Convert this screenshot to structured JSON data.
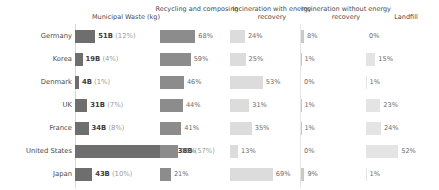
{
  "chart_data": {
    "type": "bar",
    "title": "",
    "subtitle": "",
    "xlabel": "",
    "ylabel": "",
    "grid": false,
    "legend": "none",
    "orientation": "horizontal",
    "layout": "small-multiples-row-per-country",
    "categories": [
      "Germany",
      "Korea",
      "Denmark",
      "UK",
      "France",
      "United States",
      "Japan"
    ],
    "columns": [
      {
        "key": "municipal_waste",
        "header": "Municipal Waste (kg)",
        "unit": "B",
        "value_suffix": "B",
        "max": 238,
        "color": "#6e6e6e"
      },
      {
        "key": "recycling_composting",
        "header": "Recycling and composing",
        "unit": "%",
        "max": 100,
        "color": "#8c8c8c"
      },
      {
        "key": "incineration_with_energy_recovery",
        "header": "Incineration with energy recovery",
        "unit": "%",
        "max": 100,
        "color": "#dcdcdc"
      },
      {
        "key": "incineration_without_energy_recovery",
        "header": "Incineration without energy recovery",
        "unit": "%",
        "max": 100,
        "color": "#c9c9c9"
      },
      {
        "key": "landfill",
        "header": "Landfill",
        "unit": "%",
        "max": 100,
        "color": "#e4e4e4"
      }
    ],
    "series": [
      {
        "name": "Municipal Waste (kg)",
        "values": [
          51,
          19,
          4,
          31,
          34,
          238,
          43
        ]
      },
      {
        "name": "Municipal Waste share",
        "values": [
          12,
          4,
          1,
          7,
          8,
          57,
          10
        ]
      },
      {
        "name": "Recycling and composing",
        "values": [
          68,
          59,
          46,
          44,
          41,
          35,
          21
        ]
      },
      {
        "name": "Incineration with energy recovery",
        "values": [
          24,
          25,
          53,
          31,
          35,
          13,
          69
        ]
      },
      {
        "name": "Incineration without energy recovery",
        "values": [
          8,
          1,
          0,
          1,
          1,
          0,
          9
        ]
      },
      {
        "name": "Landfill",
        "values": [
          0,
          15,
          1,
          23,
          24,
          52,
          1
        ]
      }
    ],
    "rows": [
      {
        "country": "Germany",
        "waste_value": "51B",
        "waste_pct": "(12%)",
        "waste_num": 51,
        "recycling": "68%",
        "recycling_num": 68,
        "incin_with": "24%",
        "incin_with_num": 24,
        "incin_without": "8%",
        "incin_without_num": 8,
        "landfill": "0%",
        "landfill_num": 0
      },
      {
        "country": "Korea",
        "waste_value": "19B",
        "waste_pct": "(4%)",
        "waste_num": 19,
        "recycling": "59%",
        "recycling_num": 59,
        "incin_with": "25%",
        "incin_with_num": 25,
        "incin_without": "1%",
        "incin_without_num": 1,
        "landfill": "15%",
        "landfill_num": 15
      },
      {
        "country": "Denmark",
        "waste_value": "4B",
        "waste_pct": "(1%)",
        "waste_num": 4,
        "recycling": "46%",
        "recycling_num": 46,
        "incin_with": "53%",
        "incin_with_num": 53,
        "incin_without": "0%",
        "incin_without_num": 0,
        "landfill": "1%",
        "landfill_num": 1
      },
      {
        "country": "UK",
        "waste_value": "31B",
        "waste_pct": "(7%)",
        "waste_num": 31,
        "recycling": "44%",
        "recycling_num": 44,
        "incin_with": "31%",
        "incin_with_num": 31,
        "incin_without": "1%",
        "incin_without_num": 1,
        "landfill": "23%",
        "landfill_num": 23
      },
      {
        "country": "France",
        "waste_value": "34B",
        "waste_pct": "(8%)",
        "waste_num": 34,
        "recycling": "41%",
        "recycling_num": 41,
        "incin_with": "35%",
        "incin_with_num": 35,
        "incin_without": "1%",
        "incin_without_num": 1,
        "landfill": "24%",
        "landfill_num": 24
      },
      {
        "country": "United States",
        "waste_value": "238B",
        "waste_pct": "(57%)",
        "waste_num": 238,
        "recycling": "35%",
        "recycling_num": 35,
        "incin_with": "13%",
        "incin_with_num": 13,
        "incin_without": "0%",
        "incin_without_num": 0,
        "landfill": "52%",
        "landfill_num": 52
      },
      {
        "country": "Japan",
        "waste_value": "43B",
        "waste_pct": "(10%)",
        "waste_num": 43,
        "recycling": "21%",
        "recycling_num": 21,
        "incin_with": "69%",
        "incin_with_num": 69,
        "incin_without": "9%",
        "incin_without_num": 9,
        "landfill": "1%",
        "landfill_num": 1
      }
    ]
  },
  "headers": {
    "waste": "Municipal Waste (kg)",
    "recycling": "Recycling and composing",
    "incin_with": "Incineration with energy recovery",
    "incin_without": "Incineration without energy recovery",
    "landfill": "Landfill"
  },
  "colors": {
    "waste_bar": "#6e6e6e",
    "recycling_bar": "#8c8c8c",
    "incin_with_bar": "#dcdcdc",
    "incin_without_bar": "#c9c9c9",
    "landfill_bar": "#e4e4e4",
    "text": "#4a4a4a",
    "muted_text": "#9b9b9b",
    "axis": "#d8d8d8",
    "background": "#ffffff"
  }
}
